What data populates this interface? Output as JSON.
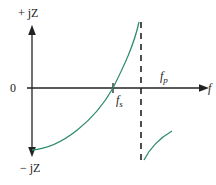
{
  "diagram": {
    "type": "reactance-vs-frequency",
    "axes": {
      "y_top_label": "+ jZ",
      "y_bottom_label": "− jZ",
      "origin_label": "0",
      "x_label": "f"
    },
    "markers": {
      "series_resonance": {
        "label": "f",
        "subscript": "s"
      },
      "parallel_resonance": {
        "label": "f",
        "subscript": "p"
      }
    },
    "colors": {
      "curve": "#2e8b6e",
      "axes": "#222222"
    }
  }
}
